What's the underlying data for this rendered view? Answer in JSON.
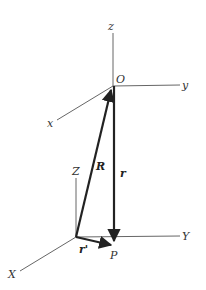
{
  "diagram": {
    "title": "",
    "colors": {
      "axis": "#666666",
      "vector": "#222222",
      "label": "#333333"
    },
    "upper_frame": {
      "origin_label": "O",
      "axes": {
        "z": "z",
        "y": "y",
        "x": "x"
      }
    },
    "lower_frame": {
      "axes": {
        "Z": "Z",
        "Y": "Y",
        "X": "X"
      }
    },
    "vectors": {
      "R": "R",
      "r": "r",
      "r_prime": "r'"
    },
    "point_label": "P"
  }
}
